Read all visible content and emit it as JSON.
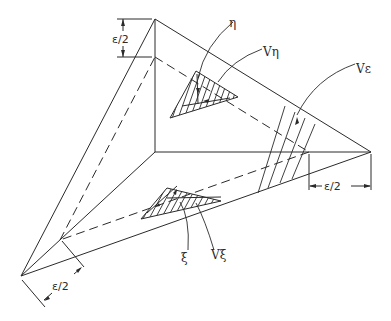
{
  "figure": {
    "type": "engineering-line-drawing"
  },
  "labels": {
    "dim_top": "ε/2",
    "dim_right": "ε/2",
    "dim_bottom_left": "ε/2",
    "eta": "η",
    "v_eta": "Vη",
    "v_epsilon": "Vε",
    "xi": "ξ",
    "v_xi": "Vξ"
  },
  "geometry": {
    "outer_vertices": {
      "top": [
        155,
        19
      ],
      "right": [
        371,
        152
      ],
      "bottom_left": [
        21,
        276
      ]
    },
    "inner_vertices": {
      "top": [
        155,
        57
      ],
      "right": [
        309,
        152
      ],
      "bottom_left": [
        60,
        240
      ]
    },
    "center": [
      155,
      152
    ],
    "upper_control_triangle": [
      [
        196,
        71
      ],
      [
        170,
        118
      ],
      [
        238,
        97
      ]
    ],
    "lower_control_triangle": [
      [
        167,
        188
      ],
      [
        141,
        219
      ],
      [
        221,
        201
      ]
    ]
  },
  "colors": {
    "ink": "#2a2a2a",
    "background": "#ffffff"
  }
}
